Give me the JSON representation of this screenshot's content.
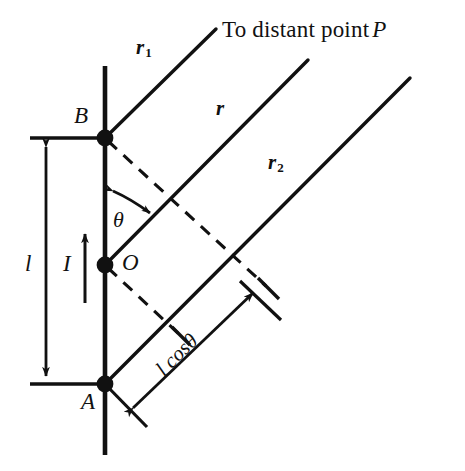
{
  "figure": {
    "kind": "physics-diagram",
    "background_color": "#ffffff",
    "ink_color": "#111111"
  },
  "title": {
    "prefix": "To distant point",
    "point_label": "P",
    "full": "To distant point P"
  },
  "points": [
    {
      "id": "B",
      "label": "B",
      "role": "upper-end-of-wire",
      "x": 105,
      "y": 138
    },
    {
      "id": "O",
      "label": "O",
      "role": "midpoint-of-wire",
      "x": 105,
      "y": 265
    },
    {
      "id": "A",
      "label": "A",
      "role": "lower-end-of-wire",
      "x": 105,
      "y": 384
    }
  ],
  "rays": [
    {
      "id": "r1",
      "label": "r",
      "subscript": "1",
      "from": "B",
      "note": "ray from upper end B to distant point P"
    },
    {
      "id": "r",
      "label": "r",
      "subscript": "",
      "note": "ray from midpoint O to distant point P"
    },
    {
      "id": "r2",
      "label": "r",
      "subscript": "2",
      "from": "A",
      "note": "ray from lower end A to distant point P"
    }
  ],
  "labels": {
    "length": "l",
    "current": "I",
    "angle": "θ",
    "projection": "l cosθ",
    "projection_parts": {
      "length": "l",
      "trig": "cos",
      "angle": "θ"
    }
  },
  "annotations": {
    "length_dimension": {
      "name": "l",
      "orientation": "vertical",
      "spans": "A to B",
      "arrowheads": "both"
    },
    "current_arrow": {
      "name": "I",
      "direction": "up",
      "meaning": "current direction along the wire"
    },
    "angle_arc": {
      "name": "θ",
      "between": [
        "wire (vertical)",
        "ray r"
      ],
      "arrowheads": "both"
    },
    "projection_dimension": {
      "name": "l cosθ",
      "orientation": "parallel to the rays (45 degrees)",
      "arrowheads": "both"
    },
    "dashed_perpendiculars": [
      {
        "from": "B",
        "to": "ray r2",
        "style": "dashed"
      },
      {
        "from": "O",
        "to": "ray r2",
        "style": "dashed"
      }
    ]
  }
}
